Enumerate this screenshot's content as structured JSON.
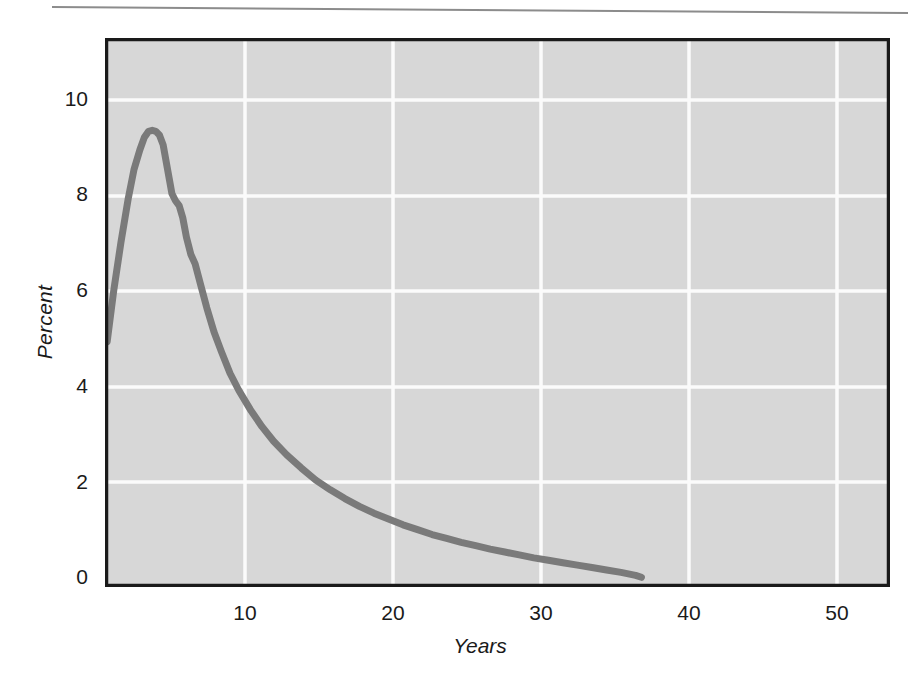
{
  "figure": {
    "background_color": "#ffffff",
    "plot_background_color": "#d7d7d7",
    "frame_color": "#1a1a1a",
    "gridline_color": "#fbfbfb",
    "curve_color": "#7a7a7a",
    "top_rule_color": "#8c8c8c"
  },
  "chart_data": {
    "type": "line",
    "title": "",
    "xlabel": "Years",
    "ylabel": "Percent",
    "xlim": [
      0,
      54
    ],
    "ylim": [
      0,
      11.3
    ],
    "grid": true,
    "legend": null,
    "xticks": [
      10,
      20,
      30,
      40,
      50
    ],
    "xtick_labels": [
      "10",
      "20",
      "30",
      "40",
      "50"
    ],
    "yticks": [
      0,
      2,
      4,
      6,
      8,
      10
    ],
    "ytick_labels": [
      "0",
      "2",
      "4",
      "6",
      "8",
      "10"
    ],
    "series": [
      {
        "name": "percent",
        "color": "#7a7a7a",
        "x": [
          0.15,
          0.6,
          1.1,
          1.6,
          2.0,
          2.4,
          2.7,
          3.0,
          3.25,
          3.5,
          3.75,
          4.0,
          4.3,
          4.6,
          4.85,
          5.1,
          5.35,
          5.6,
          5.9,
          6.2,
          6.6,
          7.0,
          7.5,
          8.0,
          8.6,
          9.2,
          10.0,
          10.8,
          11.6,
          12.5,
          13.5,
          14.5,
          15.5,
          16.5,
          17.5,
          18.5,
          19.5,
          20.5,
          21.5,
          22.5,
          23.5,
          24.5,
          25.5,
          26.5,
          27.5,
          28.5,
          29.5,
          30.5,
          31.5,
          32.5,
          33.5,
          34.5,
          35.5,
          36.5,
          36.9
        ],
        "y": [
          5.05,
          6.1,
          7.1,
          8.0,
          8.6,
          9.0,
          9.25,
          9.38,
          9.4,
          9.38,
          9.3,
          9.1,
          8.6,
          8.1,
          7.95,
          7.85,
          7.6,
          7.2,
          6.85,
          6.65,
          6.2,
          5.75,
          5.25,
          4.85,
          4.4,
          4.05,
          3.65,
          3.3,
          3.0,
          2.72,
          2.45,
          2.2,
          2.0,
          1.82,
          1.66,
          1.52,
          1.4,
          1.28,
          1.18,
          1.08,
          1.0,
          0.92,
          0.85,
          0.78,
          0.72,
          0.66,
          0.6,
          0.55,
          0.5,
          0.45,
          0.4,
          0.35,
          0.3,
          0.24,
          0.2
        ]
      }
    ]
  }
}
